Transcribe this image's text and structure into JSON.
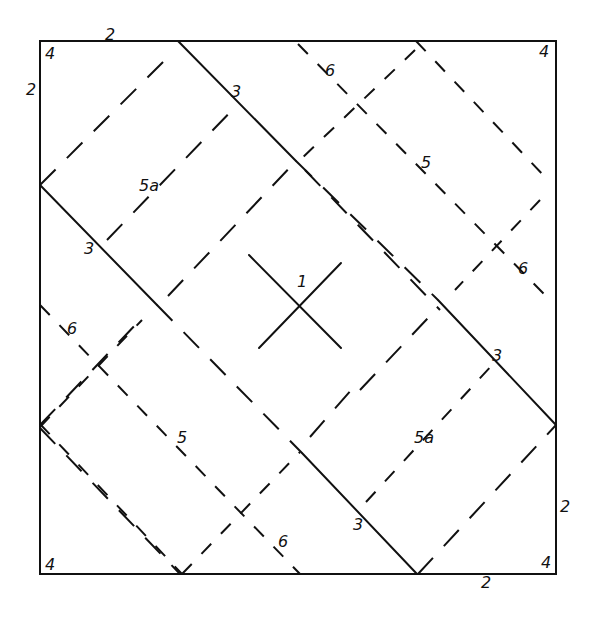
{
  "diagram": {
    "width": 598,
    "height": 636,
    "ink_color": "#111111",
    "background": "#ffffff",
    "square": {
      "x1": 40,
      "y1": 41,
      "x2": 556,
      "y2": 574
    },
    "solid_lines": [
      {
        "id": "crease-3-top",
        "x1": 178,
        "y1": 41,
        "x2": 296,
        "y2": 161
      },
      {
        "id": "crease-3-left",
        "x1": 40,
        "y1": 185,
        "x2": 157,
        "y2": 305
      },
      {
        "id": "crease-3-right",
        "x1": 438,
        "y1": 300,
        "x2": 556,
        "y2": 425
      },
      {
        "id": "crease-3-bottom",
        "x1": 302,
        "y1": 453,
        "x2": 417,
        "y2": 574
      },
      {
        "id": "center-x-diag-a",
        "x1": 249,
        "y1": 255,
        "x2": 341,
        "y2": 348
      },
      {
        "id": "center-x-diag-b",
        "x1": 259,
        "y1": 348,
        "x2": 341,
        "y2": 263
      }
    ],
    "long_dash_lines": [
      {
        "id": "main-diag-nw-se",
        "x1": 296,
        "y1": 161,
        "x2": 438,
        "y2": 300
      },
      {
        "id": "main-diag-nw-se-2",
        "x1": 157,
        "y1": 305,
        "x2": 302,
        "y2": 453
      },
      {
        "id": "upper-left-box-a",
        "x1": 40,
        "y1": 185,
        "x2": 165,
        "y2": 60
      },
      {
        "id": "upper-left-box-b",
        "x1": 107,
        "y1": 240,
        "x2": 238,
        "y2": 104
      },
      {
        "id": "mid-diag-sw-ne",
        "x1": 168,
        "y1": 296,
        "x2": 296,
        "y2": 161
      },
      {
        "id": "lower-left-box-a",
        "x1": 40,
        "y1": 425,
        "x2": 140,
        "y2": 320
      },
      {
        "id": "lower-right-box-a",
        "x1": 418,
        "y1": 574,
        "x2": 556,
        "y2": 425
      },
      {
        "id": "lower-right-box-b",
        "x1": 360,
        "y1": 390,
        "x2": 428,
        "y2": 318
      },
      {
        "id": "center-low-ne",
        "x1": 310,
        "y1": 437,
        "x2": 360,
        "y2": 380
      },
      {
        "id": "right-diag-a",
        "x1": 305,
        "y1": 170,
        "x2": 440,
        "y2": 310
      },
      {
        "id": "left-low-diag",
        "x1": 40,
        "y1": 428,
        "x2": 180,
        "y2": 574
      }
    ],
    "short_dash_lines": [
      {
        "id": "line-6-top-nw-se",
        "x1": 298,
        "y1": 44,
        "x2": 545,
        "y2": 295
      },
      {
        "id": "line-6-top-ne",
        "x1": 415,
        "y1": 50,
        "x2": 300,
        "y2": 160
      },
      {
        "id": "line-5-right",
        "x1": 416,
        "y1": 41,
        "x2": 546,
        "y2": 178
      },
      {
        "id": "line-6-right-sw",
        "x1": 540,
        "y1": 200,
        "x2": 455,
        "y2": 290
      },
      {
        "id": "line-6-left-nw-se",
        "x1": 40,
        "y1": 305,
        "x2": 300,
        "y2": 574
      },
      {
        "id": "line-5-left-sw-ne",
        "x1": 40,
        "y1": 427,
        "x2": 142,
        "y2": 320
      },
      {
        "id": "line-5-bottom-sw-ne",
        "x1": 182,
        "y1": 574,
        "x2": 300,
        "y2": 452
      },
      {
        "id": "line-5a-inner",
        "x1": 366,
        "y1": 502,
        "x2": 494,
        "y2": 363
      },
      {
        "id": "line-5-left-diag",
        "x1": 40,
        "y1": 424,
        "x2": 182,
        "y2": 574
      }
    ],
    "labels": [
      {
        "id": "label-2-top",
        "text": "2",
        "x": 105,
        "y": 40
      },
      {
        "id": "label-4-top-left",
        "text": "4",
        "x": 45,
        "y": 59
      },
      {
        "id": "label-2-left",
        "text": "2",
        "x": 26,
        "y": 95
      },
      {
        "id": "label-3-top",
        "text": "3",
        "x": 231,
        "y": 97
      },
      {
        "id": "label-6-top",
        "text": "6",
        "x": 325,
        "y": 76
      },
      {
        "id": "label-4-top-right",
        "text": "4",
        "x": 539,
        "y": 57
      },
      {
        "id": "label-5a-upper",
        "text": "5a",
        "x": 139,
        "y": 191
      },
      {
        "id": "label-5-upper-right",
        "text": "5",
        "x": 421,
        "y": 168
      },
      {
        "id": "label-3-left",
        "text": "3",
        "x": 84,
        "y": 254
      },
      {
        "id": "label-6-right",
        "text": "6",
        "x": 518,
        "y": 274
      },
      {
        "id": "label-1-center",
        "text": "1",
        "x": 297,
        "y": 287
      },
      {
        "id": "label-6-left",
        "text": "6",
        "x": 67,
        "y": 334
      },
      {
        "id": "label-3-right",
        "text": "3",
        "x": 492,
        "y": 361
      },
      {
        "id": "label-5-lower-left",
        "text": "5",
        "x": 177,
        "y": 443
      },
      {
        "id": "label-5a-lower",
        "text": "5a",
        "x": 414,
        "y": 443
      },
      {
        "id": "label-2-right",
        "text": "2",
        "x": 560,
        "y": 512
      },
      {
        "id": "label-3-bottom",
        "text": "3",
        "x": 353,
        "y": 530
      },
      {
        "id": "label-6-bottom",
        "text": "6",
        "x": 278,
        "y": 547
      },
      {
        "id": "label-4-bottom-left",
        "text": "4",
        "x": 45,
        "y": 570
      },
      {
        "id": "label-4-bottom-right",
        "text": "4",
        "x": 541,
        "y": 568
      },
      {
        "id": "label-2-bottom",
        "text": "2",
        "x": 481,
        "y": 588
      }
    ]
  }
}
